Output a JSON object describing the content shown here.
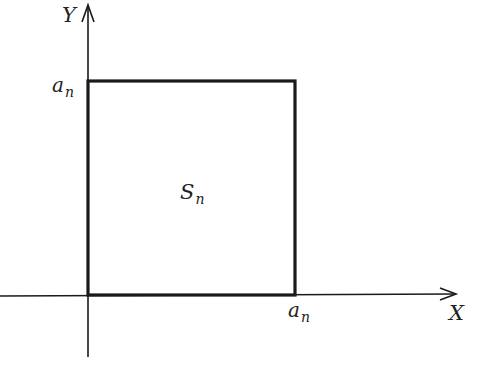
{
  "diagram": {
    "axes": {
      "x_label": "X",
      "y_label": "Y"
    },
    "square": {
      "label_main": "S",
      "label_sub": "n"
    },
    "tick_labels": {
      "y_tick_main": "a",
      "y_tick_sub": "n",
      "x_tick_main": "a",
      "x_tick_sub": "n"
    },
    "colors": {
      "stroke": "#1a1a1a",
      "background": "#ffffff"
    }
  }
}
